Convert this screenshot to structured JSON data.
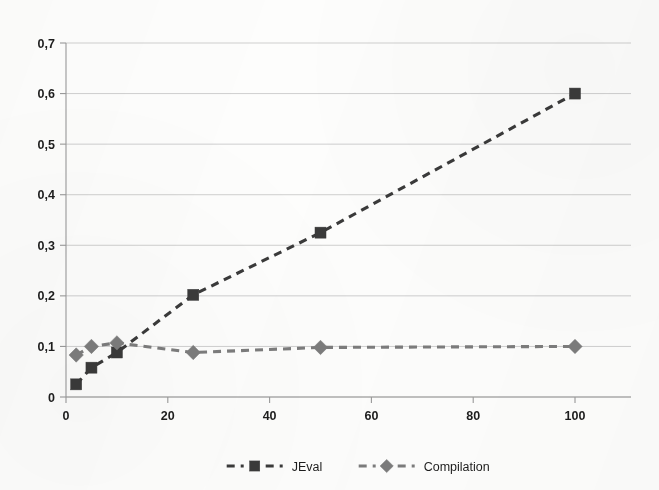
{
  "chart_data": {
    "type": "line",
    "title": "",
    "subtitle": "",
    "xlabel": "",
    "ylabel": "",
    "xlim": [
      0,
      111
    ],
    "ylim": [
      0,
      0.7
    ],
    "grid": "horizontal",
    "decimal_separator": ",",
    "x_ticks": [
      0,
      20,
      40,
      60,
      80,
      100
    ],
    "x_tick_labels": [
      "0",
      "20",
      "40",
      "60",
      "80",
      "100"
    ],
    "y_ticks": [
      0,
      0.1,
      0.2,
      0.3,
      0.4,
      0.5,
      0.6,
      0.7
    ],
    "y_tick_labels": [
      "0",
      "0,1",
      "0,2",
      "0,3",
      "0,4",
      "0,5",
      "0,6",
      "0,7"
    ],
    "legend_position": "bottom",
    "x": [
      2,
      5,
      10,
      25,
      50,
      100
    ],
    "series": [
      {
        "name": "JEval",
        "marker": "square",
        "line_style": "dashed",
        "color": "#3a3a3a",
        "values": [
          0.025,
          0.058,
          0.088,
          0.202,
          0.325,
          0.6
        ]
      },
      {
        "name": "Compilation",
        "marker": "diamond",
        "line_style": "dashed",
        "color": "#7c7c7c",
        "values": [
          0.083,
          0.1,
          0.107,
          0.088,
          0.098,
          0.1
        ]
      }
    ]
  },
  "legend": {
    "items": [
      {
        "label": "JEval",
        "marker": "square",
        "color": "#3a3a3a"
      },
      {
        "label": "Compilation",
        "marker": "diamond",
        "color": "#7c7c7c"
      }
    ]
  },
  "axes": {
    "y_axis_name": "value-axis",
    "x_axis_name": "category-axis"
  },
  "colors": {
    "background": "#fdfdfc",
    "grid": "#c9c9c9",
    "axis": "#9a9a9a",
    "series_jeval": "#3a3a3a",
    "series_compilation": "#7c7c7c",
    "text": "#1d1d1d"
  }
}
